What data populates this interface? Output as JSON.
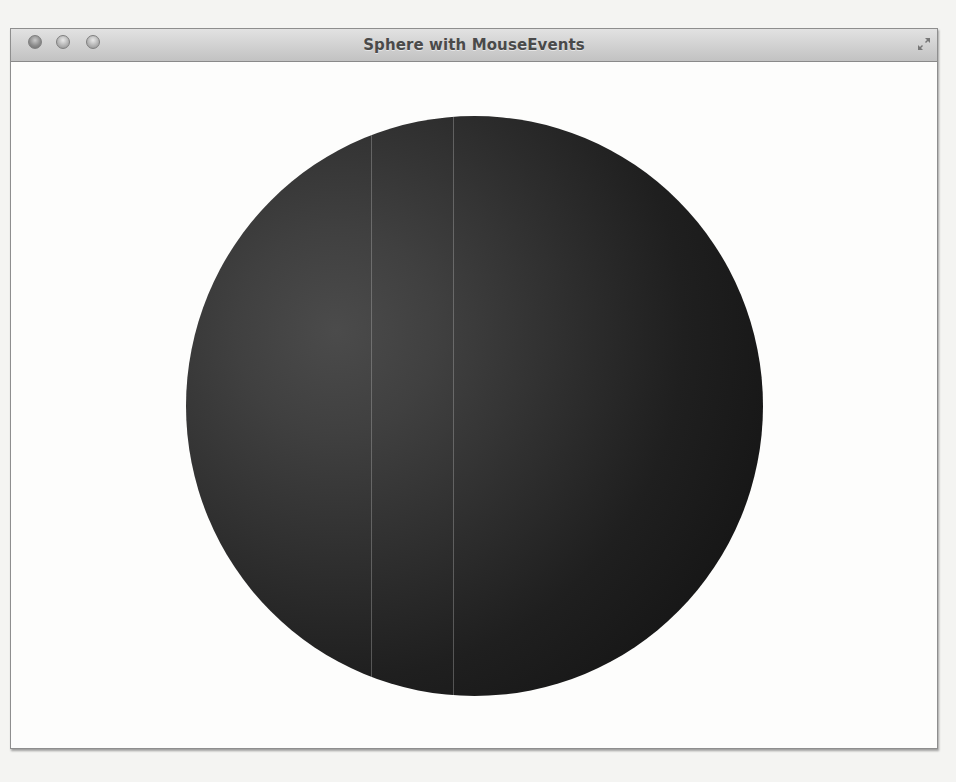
{
  "window": {
    "title": "Sphere with MouseEvents",
    "controls": {
      "close": "close-button",
      "minimize": "minimize-button",
      "zoom": "zoom-button",
      "fullscreen": "fullscreen-button"
    }
  },
  "scene": {
    "object": "sphere",
    "colors": {
      "highlight": "#4b4b4b",
      "mid": "#2e2e2e",
      "shadow": "#121212",
      "background": "#fdfdfc"
    }
  }
}
